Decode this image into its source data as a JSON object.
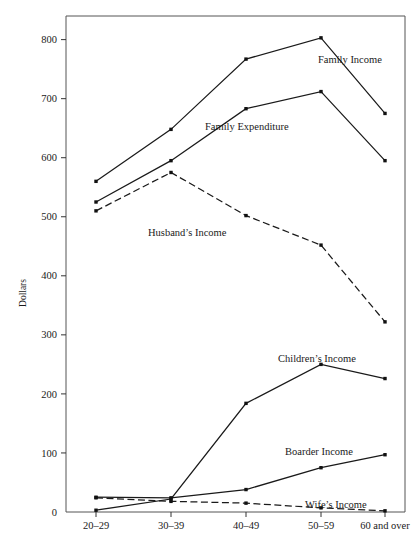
{
  "chart_data": {
    "type": "line",
    "title": "",
    "subtitle": "",
    "xlabel": "",
    "ylabel": "Dollars",
    "categories": [
      "20–29",
      "30–39",
      "40–49",
      "50–59",
      "60 and over"
    ],
    "ylim": [
      0,
      840
    ],
    "ytick_values": [
      0,
      100,
      200,
      300,
      400,
      500,
      600,
      700,
      800
    ],
    "ytick_labels": [
      "0",
      "100",
      "200",
      "300",
      "400",
      "500",
      "600",
      "700",
      "800"
    ],
    "grid": false,
    "legend_position": "inline-annotations",
    "series": [
      {
        "name": "Family Income",
        "style": "solid",
        "values": [
          560,
          648,
          767,
          803,
          675
        ],
        "label_text": "Family Income"
      },
      {
        "name": "Family Expenditure",
        "style": "solid",
        "values": [
          525,
          595,
          683,
          712,
          595
        ],
        "label_text": "Family Expenditure"
      },
      {
        "name": "Husband's Income",
        "style": "dashed",
        "values": [
          510,
          575,
          502,
          452,
          322
        ],
        "label_text": "Husband’s Income"
      },
      {
        "name": "Children's Income",
        "style": "solid",
        "values": [
          3,
          22,
          184,
          250,
          226
        ],
        "label_text": "Children’s Income"
      },
      {
        "name": "Boarder Income",
        "style": "solid",
        "values": [
          25,
          24,
          38,
          75,
          97
        ],
        "label_text": "Boarder Income"
      },
      {
        "name": "Wife's Income",
        "style": "dashed",
        "values": [
          24,
          18,
          15,
          7,
          2
        ],
        "label_text": "Wife’s Income"
      }
    ],
    "annotations": [
      {
        "text": "Family Income",
        "x": 318,
        "y": 63,
        "anchor": "start"
      },
      {
        "text": "Family Expenditure",
        "x": 205,
        "y": 130,
        "anchor": "start"
      },
      {
        "text": "Husband’s Income",
        "x": 148,
        "y": 236,
        "anchor": "start"
      },
      {
        "text": "Children’s Income",
        "x": 278,
        "y": 362,
        "anchor": "start"
      },
      {
        "text": "Boarder Income",
        "x": 285,
        "y": 455,
        "anchor": "start"
      },
      {
        "text": "Wife’s Income",
        "x": 305,
        "y": 508,
        "anchor": "start"
      }
    ]
  },
  "axes": {
    "y_axis_title": "Dollars"
  }
}
